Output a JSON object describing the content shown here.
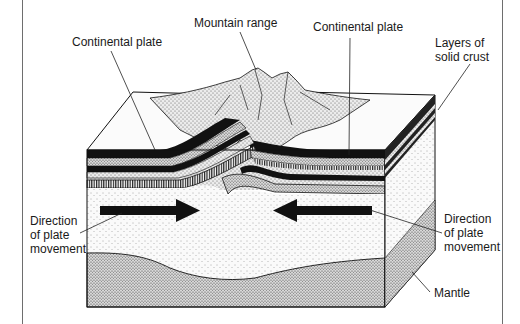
{
  "diagram": {
    "labels": {
      "continental_plate_left": "Continental plate",
      "mountain_range": "Mountain range",
      "continental_plate_right": "Continental plate",
      "layers_of_solid_crust": [
        "Layers of",
        "solid crust"
      ],
      "direction_left": [
        "Direction",
        "of plate",
        "movement"
      ],
      "direction_right": [
        "Direction",
        "of plate",
        "movement"
      ],
      "mantle": "Mantle"
    },
    "arrows": [
      {
        "name": "left-plate-arrow",
        "direction": "right"
      },
      {
        "name": "right-plate-arrow",
        "direction": "left"
      }
    ],
    "colors": {
      "ink": "#111111",
      "paper": "#ffffff",
      "frame": "#6e6e6e",
      "stipple_light": "#e6e6e6",
      "stipple_mid": "#c9c9c9",
      "stipple_dark": "#a9a9a9"
    }
  }
}
